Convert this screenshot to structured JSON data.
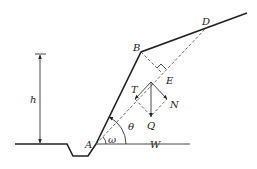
{
  "diagram": {
    "labels": {
      "h": "h",
      "A": "A",
      "B": "B",
      "D": "D",
      "E": "E",
      "T": "T",
      "N": "N",
      "Q": "Q",
      "W": "W",
      "theta": "θ",
      "omega": "ω"
    },
    "colors": {
      "line": "#222222",
      "background": "#ffffff"
    }
  }
}
